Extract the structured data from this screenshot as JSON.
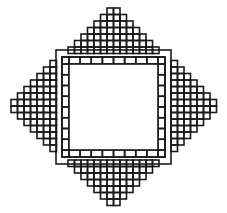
{
  "figure": {
    "stroke_color": "#1a1a1a",
    "background": "#ffffff",
    "cell": 6.5,
    "center": [
      113.5,
      106
    ],
    "inner_square": {
      "x": 69,
      "y": 64,
      "w": 89,
      "h": 86
    },
    "frame": {
      "x": 62,
      "y": 57,
      "w": 103,
      "h": 100,
      "cells_per_side": 8
    },
    "triangles": [
      {
        "name": "top",
        "rows": 7
      },
      {
        "name": "bottom",
        "rows": 7
      },
      {
        "name": "left",
        "rows": 7
      },
      {
        "name": "right",
        "rows": 7
      }
    ]
  }
}
